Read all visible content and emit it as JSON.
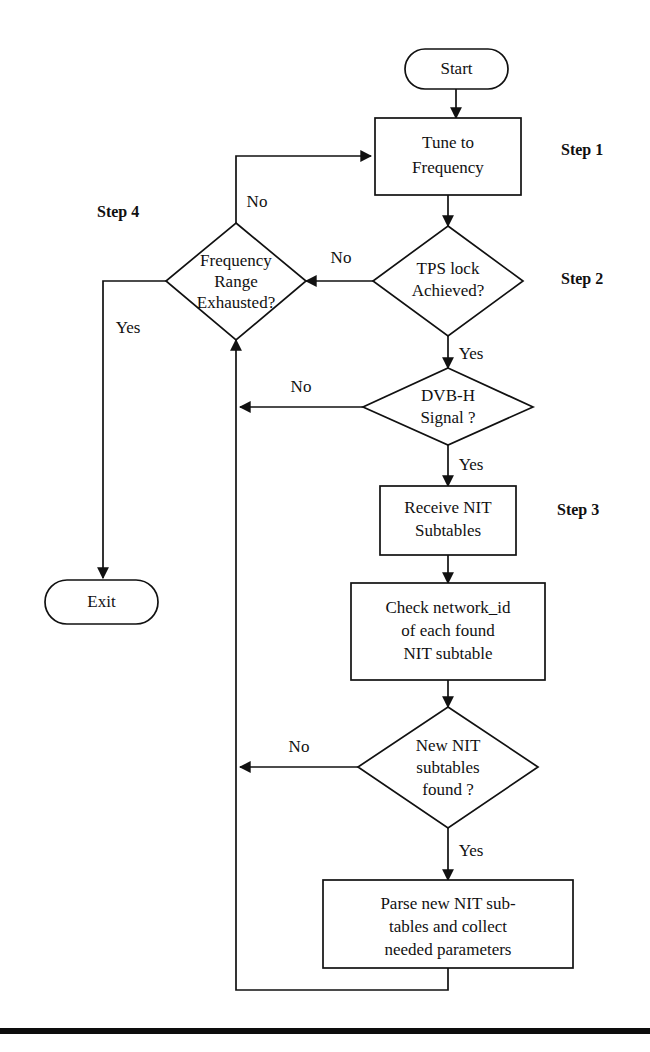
{
  "diagram": {
    "background_color": "#ffffff",
    "line_color": "#111111",
    "nodes": {
      "start": {
        "label": "Start",
        "shape": "terminator"
      },
      "tune": {
        "line1": "Tune to",
        "line2": "Frequency",
        "shape": "process"
      },
      "tps_lock": {
        "line1": "TPS lock",
        "line2": "Achieved?",
        "shape": "decision"
      },
      "freq_exhausted": {
        "line1": "Frequency",
        "line2": "Range",
        "line3": "Exhausted?",
        "shape": "decision"
      },
      "dvbh_signal": {
        "line1": "DVB-H",
        "line2": "Signal ?",
        "shape": "decision"
      },
      "receive_nit": {
        "line1": "Receive NIT",
        "line2": "Subtables",
        "shape": "process"
      },
      "check_network_id": {
        "line1": "Check network_id",
        "line2": "of each found",
        "line3": "NIT subtable",
        "shape": "process"
      },
      "new_nit_found": {
        "line1": "New NIT",
        "line2": "subtables",
        "line3": "found ?",
        "shape": "decision"
      },
      "parse_nit": {
        "line1": "Parse new NIT sub-",
        "line2": "tables and collect",
        "line3": "needed parameters",
        "shape": "process"
      },
      "exit": {
        "label": "Exit",
        "shape": "terminator"
      }
    },
    "edge_labels": {
      "freq_exhausted_no": "No",
      "freq_exhausted_yes": "Yes",
      "tps_lock_no": "No",
      "tps_lock_yes": "Yes",
      "dvbh_no": "No",
      "dvbh_yes": "Yes",
      "new_nit_no": "No",
      "new_nit_yes": "Yes"
    },
    "step_labels": {
      "step1": "Step 1",
      "step2": "Step 2",
      "step3": "Step 3",
      "step4": "Step 4"
    }
  }
}
